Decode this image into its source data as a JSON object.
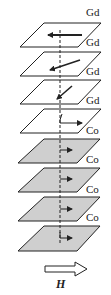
{
  "layers": [
    {
      "element": "Gd",
      "fill": "#ffffff",
      "arrow": "left"
    },
    {
      "element": "Gd",
      "fill": "#ffffff",
      "arrow": "down-left"
    },
    {
      "element": "Gd",
      "fill": "#ffffff",
      "arrow": "down-left-steep"
    },
    {
      "element": "Gd",
      "fill": "#ffffff",
      "arrow": "up-right-cant"
    },
    {
      "element": "Co",
      "fill": "#cfcfcf",
      "arrow": "right"
    },
    {
      "element": "Co",
      "fill": "#cfcfcf",
      "arrow": "right"
    },
    {
      "element": "Co",
      "fill": "#cfcfcf",
      "arrow": "right"
    },
    {
      "element": "Co",
      "fill": "#cfcfcf",
      "arrow": "right"
    },
    {
      "element": "",
      "fill": "#cfcfcf",
      "arrow": "right"
    }
  ],
  "labels": [
    "Gd",
    "Gd",
    "Gd",
    "Gd",
    "Co",
    "Co",
    "Co",
    "Co"
  ],
  "field": {
    "label": "H",
    "icon": "hollow-right-arrow-icon"
  },
  "colors": {
    "line": "#222222",
    "gd_fill": "#ffffff",
    "co_fill": "#cfcfcf"
  }
}
